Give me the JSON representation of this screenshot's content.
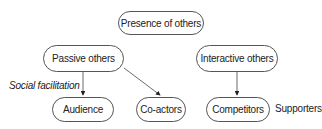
{
  "diagram": {
    "nodes": {
      "root": "Presence of others",
      "passive": "Passive others",
      "interactive": "Interactive others",
      "audience": "Audience",
      "coactors": "Co-actors",
      "competitors": "Competitors"
    },
    "labels": {
      "social_facilitation": "Social facilitation",
      "supporters": "Supporters"
    },
    "edges": [
      {
        "from": "Passive others",
        "to": "Audience"
      },
      {
        "from": "Passive others",
        "to": "Co-actors"
      },
      {
        "from": "Interactive others",
        "to": "Competitors"
      }
    ],
    "colors": {
      "stroke": "#555555",
      "text": "#222222",
      "background": "#ffffff"
    }
  }
}
